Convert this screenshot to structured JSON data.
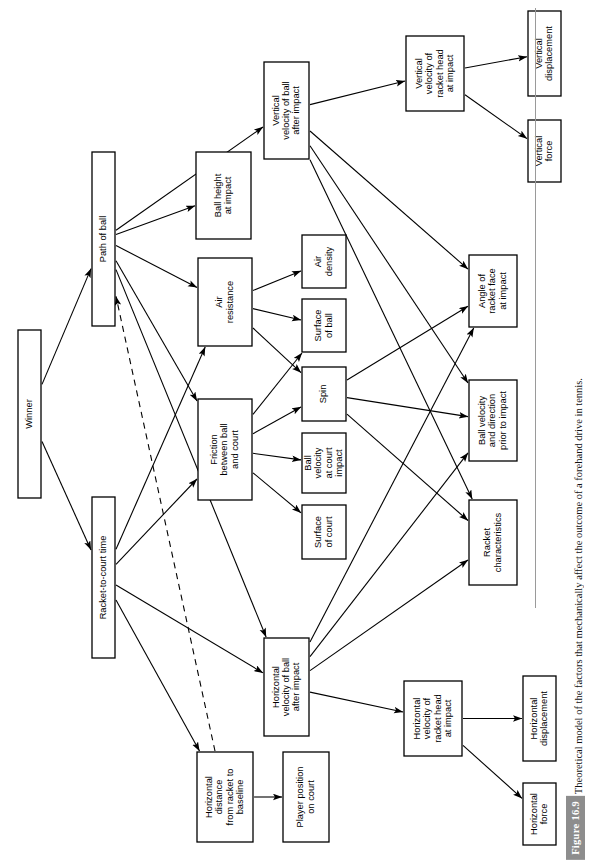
{
  "figure": {
    "tag": "Figure 16.9",
    "caption": "Theoretical model of the factors that mechanically affect the outcome of a forehand drive in tennis."
  },
  "diagram": {
    "type": "flowchart",
    "orientation": "rotated-90-ccw",
    "nodes": [
      {
        "id": "winner",
        "label": "Winner",
        "x": 18,
        "y": 330,
        "w": 23,
        "h": 168
      },
      {
        "id": "path",
        "label": "Path of ball",
        "x": 92,
        "y": 152,
        "w": 23,
        "h": 174
      },
      {
        "id": "rct",
        "label": "Racket-to-court time",
        "x": 92,
        "y": 497,
        "w": 23,
        "h": 161
      },
      {
        "id": "ballheight",
        "label": "Ball height\nat impact",
        "x": 196,
        "y": 152,
        "w": 55,
        "h": 87
      },
      {
        "id": "airres",
        "label": "Air\nresistance",
        "x": 198,
        "y": 258,
        "w": 54,
        "h": 88
      },
      {
        "id": "friction",
        "label": "Friction\nbetween ball\nand court",
        "x": 198,
        "y": 399,
        "w": 54,
        "h": 101
      },
      {
        "id": "vvball",
        "label": "Vertical\nvelocity of ball\nafter impact",
        "x": 264,
        "y": 62,
        "w": 45,
        "h": 97
      },
      {
        "id": "hvball",
        "label": "Horizontal\nvelocity of ball\nafter impact",
        "x": 264,
        "y": 638,
        "w": 45,
        "h": 98
      },
      {
        "id": "airdens",
        "label": "Air\ndensity",
        "x": 302,
        "y": 235,
        "w": 44,
        "h": 53
      },
      {
        "id": "surfball",
        "label": "Surface\nof ball",
        "x": 302,
        "y": 299,
        "w": 44,
        "h": 53
      },
      {
        "id": "spin",
        "label": "Spin",
        "x": 302,
        "y": 367,
        "w": 44,
        "h": 54
      },
      {
        "id": "bvcourt",
        "label": "Ball\nvelocity\nat court\nimpact",
        "x": 302,
        "y": 433,
        "w": 44,
        "h": 60
      },
      {
        "id": "surfcourt",
        "label": "Surface\nof court",
        "x": 302,
        "y": 505,
        "w": 44,
        "h": 54
      },
      {
        "id": "hdist",
        "label": "Horizontal\ndistance\nfrom racket to\nbaseline",
        "x": 197,
        "y": 752,
        "w": 56,
        "h": 90
      },
      {
        "id": "playerpos",
        "label": "Player position\non court",
        "x": 283,
        "y": 752,
        "w": 46,
        "h": 90
      },
      {
        "id": "vvracket",
        "label": "Vertical\nvelocity of\nracket head\nat impact",
        "x": 406,
        "y": 36,
        "w": 58,
        "h": 75
      },
      {
        "id": "hvracket",
        "label": "Horizontal\nvelocity of\nracket head\nat impact",
        "x": 404,
        "y": 681,
        "w": 58,
        "h": 75
      },
      {
        "id": "angleface",
        "label": "Angle of\nracket face\nat impact",
        "x": 469,
        "y": 255,
        "w": 48,
        "h": 72
      },
      {
        "id": "bvprior",
        "label": "Ball velocity\nand direction\nprior to impact",
        "x": 469,
        "y": 380,
        "w": 48,
        "h": 81
      },
      {
        "id": "racketchar",
        "label": "Racket\ncharacteristics",
        "x": 469,
        "y": 500,
        "w": 48,
        "h": 85
      },
      {
        "id": "vdisp",
        "label": "Vertical\ndisplacement",
        "x": 528,
        "y": 11,
        "w": 33,
        "h": 85
      },
      {
        "id": "vforce",
        "label": "Vertical\nforce",
        "x": 528,
        "y": 120,
        "w": 33,
        "h": 62
      },
      {
        "id": "hdisp",
        "label": "Horizontal\ndisplacement",
        "x": 523,
        "y": 676,
        "w": 33,
        "h": 85
      },
      {
        "id": "hforce",
        "label": "Horizontal\nforce",
        "x": 523,
        "y": 783,
        "w": 33,
        "h": 62
      }
    ],
    "edges": [
      {
        "from": "winner",
        "to": "path",
        "style": "solid"
      },
      {
        "from": "winner",
        "to": "rct",
        "style": "solid"
      },
      {
        "from": "path",
        "to": "vvball",
        "style": "solid"
      },
      {
        "from": "path",
        "to": "ballheight",
        "style": "solid"
      },
      {
        "from": "path",
        "to": "airres",
        "style": "solid"
      },
      {
        "from": "path",
        "to": "friction",
        "style": "solid"
      },
      {
        "from": "path",
        "to": "hvball",
        "style": "solid"
      },
      {
        "from": "hdist",
        "to": "path",
        "style": "dashed"
      },
      {
        "from": "rct",
        "to": "airres",
        "style": "solid"
      },
      {
        "from": "rct",
        "to": "friction",
        "style": "solid"
      },
      {
        "from": "rct",
        "to": "hvball",
        "style": "solid"
      },
      {
        "from": "rct",
        "to": "hdist",
        "style": "solid"
      },
      {
        "from": "airres",
        "to": "airdens",
        "style": "solid"
      },
      {
        "from": "airres",
        "to": "surfball",
        "style": "solid"
      },
      {
        "from": "airres",
        "to": "spin",
        "style": "solid"
      },
      {
        "from": "friction",
        "to": "surfball",
        "style": "solid"
      },
      {
        "from": "friction",
        "to": "spin",
        "style": "solid"
      },
      {
        "from": "friction",
        "to": "bvcourt",
        "style": "solid"
      },
      {
        "from": "friction",
        "to": "surfcourt",
        "style": "solid"
      },
      {
        "from": "vvball",
        "to": "vvracket",
        "style": "solid"
      },
      {
        "from": "vvball",
        "to": "angleface",
        "style": "solid"
      },
      {
        "from": "vvball",
        "to": "bvprior",
        "style": "solid"
      },
      {
        "from": "vvball",
        "to": "racketchar",
        "style": "solid"
      },
      {
        "from": "hvball",
        "to": "angleface",
        "style": "solid"
      },
      {
        "from": "hvball",
        "to": "bvprior",
        "style": "solid"
      },
      {
        "from": "hvball",
        "to": "racketchar",
        "style": "solid"
      },
      {
        "from": "hvball",
        "to": "hvracket",
        "style": "solid"
      },
      {
        "from": "spin",
        "to": "angleface",
        "style": "solid"
      },
      {
        "from": "spin",
        "to": "bvprior",
        "style": "solid"
      },
      {
        "from": "spin",
        "to": "racketchar",
        "style": "solid"
      },
      {
        "from": "vvracket",
        "to": "vdisp",
        "style": "solid"
      },
      {
        "from": "vvracket",
        "to": "vforce",
        "style": "solid"
      },
      {
        "from": "hvracket",
        "to": "hdisp",
        "style": "solid"
      },
      {
        "from": "hvracket",
        "to": "hforce",
        "style": "solid"
      },
      {
        "from": "hdist",
        "to": "playerpos",
        "style": "solid"
      }
    ]
  }
}
